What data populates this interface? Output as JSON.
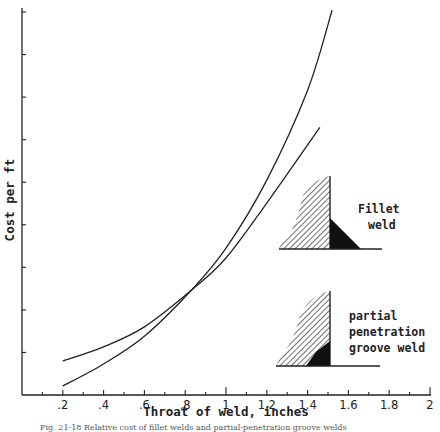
{
  "chart_data": {
    "type": "line",
    "title": "",
    "caption": "Fig. 21-18  Relative cost of fillet welds and partial-penetration groove welds",
    "xlabel": "Throat of weld, inches",
    "ylabel": "Cost per ft",
    "xlim": [
      0,
      2
    ],
    "ylim": [
      0,
      9
    ],
    "x_ticks": [
      ".2",
      ".4",
      ".6",
      ".8",
      "1",
      "1.2",
      "1.4",
      "1.6",
      "1.8",
      "2"
    ],
    "x_tick_values": [
      0.2,
      0.4,
      0.6,
      0.8,
      1.0,
      1.2,
      1.4,
      1.6,
      1.8,
      2.0
    ],
    "x_minor_tick_values": [
      0.1,
      0.3,
      0.5,
      0.7,
      0.9,
      1.1,
      1.3,
      1.5,
      1.7,
      1.9
    ],
    "y_tick_values": [
      1,
      2,
      3,
      4,
      5,
      6,
      7,
      8,
      9
    ],
    "y_tick_labels_shown": false,
    "grid": false,
    "legend": "inline annotations (right side)",
    "series": [
      {
        "name": "Fillet weld",
        "x": [
          0.2,
          0.4,
          0.6,
          0.83,
          1.0,
          1.2,
          1.4,
          1.52
        ],
        "y": [
          0.21,
          0.73,
          1.38,
          2.46,
          3.45,
          5.05,
          7.16,
          9.04
        ]
      },
      {
        "name": "Partial penetration groove weld",
        "x": [
          0.2,
          0.4,
          0.6,
          0.83,
          1.0,
          1.2,
          1.46
        ],
        "y": [
          0.8,
          1.13,
          1.6,
          2.46,
          3.22,
          4.51,
          6.29
        ]
      }
    ],
    "annotations": [
      {
        "text_lines": [
          "Fillet",
          "weld"
        ],
        "refers_to": "Fillet weld",
        "icon": "fillet-weld-cross-section"
      },
      {
        "text_lines": [
          "partial",
          "penetration",
          "groove weld"
        ],
        "refers_to": "Partial penetration groove weld",
        "icon": "groove-weld-cross-section"
      }
    ]
  }
}
